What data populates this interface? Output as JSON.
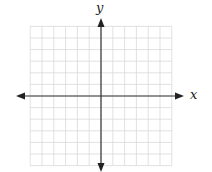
{
  "diagram": {
    "type": "coordinate-plane",
    "x_axis_label": "x",
    "y_axis_label": "y",
    "grid": {
      "x_min": -6,
      "x_max": 6,
      "y_min": -6,
      "y_max": 6,
      "step": 1,
      "line_color": "#d9d9d9",
      "axis_color": "#333333"
    }
  }
}
